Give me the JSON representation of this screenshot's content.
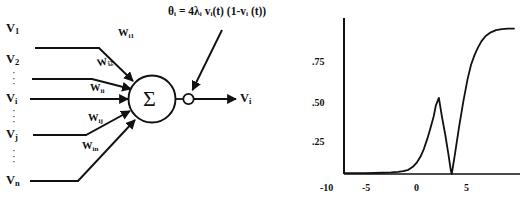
{
  "figure": {
    "left_panel": {
      "title": "artificial-neuron-diagram",
      "inputs": [
        {
          "base": "V",
          "sub": "1"
        },
        {
          "base": "V",
          "sub": "2"
        },
        {
          "base": "V",
          "sub": "i"
        },
        {
          "base": "V",
          "sub": "j"
        },
        {
          "base": "V",
          "sub": "n"
        }
      ],
      "weights": [
        {
          "base": "W",
          "sub": "i1"
        },
        {
          "base": "W",
          "sub": "i2"
        },
        {
          "base": "W",
          "sub": "ii"
        },
        {
          "base": "W",
          "sub": "ij"
        },
        {
          "base": "W",
          "sub": "in"
        }
      ],
      "ellipsis": "·",
      "summation_symbol": "Σ",
      "output": {
        "base": "V",
        "sub": "i"
      },
      "threshold_formula": "θᵢ =  4λᵢ vᵢ(t) (1-vᵢ (t))"
    },
    "right_panel": {
      "title": "activation-plot"
    }
  },
  "chart_data": {
    "type": "line",
    "title": "",
    "xlabel": "",
    "ylabel": "",
    "xlim": [
      -11.5,
      9.0
    ],
    "ylim": [
      0.0,
      1.0
    ],
    "grid": false,
    "legend": null,
    "xticks": [
      -10,
      -5,
      0,
      5
    ],
    "xticklabels": [
      "-10",
      "-5",
      "0",
      "5"
    ],
    "yticks": [
      0.25,
      0.5,
      0.75
    ],
    "yticklabels": [
      ".25",
      ".50",
      ".75"
    ],
    "series": [
      {
        "name": "activation",
        "x": [
          -11.5,
          -9.0,
          -7.0,
          -6.0,
          -5.2,
          -4.6,
          -4.0,
          -3.4,
          -3.0,
          -2.6,
          -2.2,
          -1.8,
          -1.4,
          -1.05,
          -0.8,
          -0.45,
          -0.1,
          0.3,
          0.65,
          0.95,
          1.05,
          1.4,
          1.9,
          2.4,
          2.9,
          3.3,
          3.7,
          4.1,
          4.5,
          5.0,
          5.6,
          6.2,
          6.9,
          7.6,
          8.3
        ],
        "y": [
          0.005,
          0.006,
          0.008,
          0.01,
          0.013,
          0.018,
          0.027,
          0.05,
          0.075,
          0.11,
          0.16,
          0.225,
          0.3,
          0.37,
          0.44,
          0.488,
          0.37,
          0.25,
          0.13,
          0.02,
          0.0,
          0.12,
          0.3,
          0.465,
          0.61,
          0.7,
          0.762,
          0.81,
          0.85,
          0.885,
          0.908,
          0.922,
          0.929,
          0.932,
          0.932
        ]
      }
    ]
  }
}
